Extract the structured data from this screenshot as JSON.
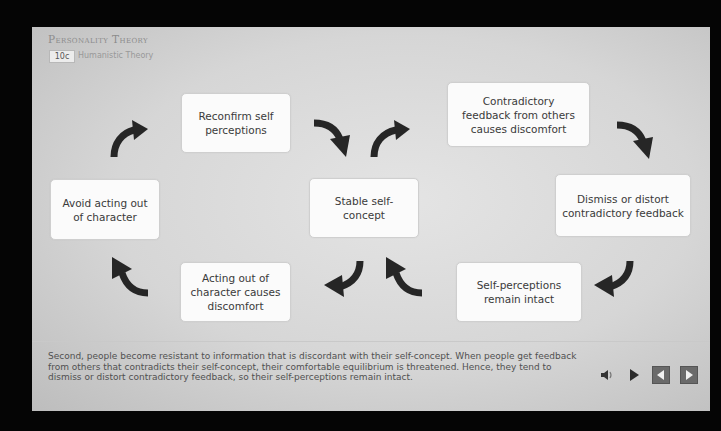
{
  "header": {
    "course_title": "Personality Theory",
    "lesson_badge": "10c",
    "lesson_title": "Humanistic Theory"
  },
  "diagram": {
    "nodes": {
      "stable": "Stable self-concept",
      "contradictory": "Contradictory feedback from others causes discomfort",
      "dismiss": "Dismiss or distort contradictory feedback",
      "intact": "Self-perceptions remain intact",
      "acting_out": "Acting out of character causes discomfort",
      "avoid": "Avoid acting out of character",
      "reconfirm": "Reconfirm self perceptions"
    },
    "arrow_color": "#262626"
  },
  "caption": "Second, people become resistant to information that is discordant with their self-concept. When people get feedback from others that contradicts their self-concept, their comfortable equilibrium is threatened. Hence, they tend to dismiss or distort contradictory feedback, so their self-perceptions remain intact.",
  "controls": {
    "audio_icon": "speaker-icon",
    "play_icon": "play-icon",
    "prev_icon": "previous-icon",
    "next_icon": "next-icon"
  }
}
